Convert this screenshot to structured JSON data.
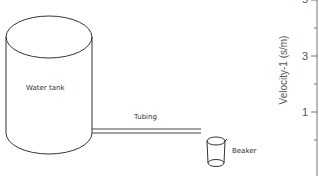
{
  "diagram": {
    "tank": {
      "label": "Water tank"
    },
    "tubing": {
      "label": "Tubing"
    },
    "beaker": {
      "label": "Beaker"
    }
  },
  "axis": {
    "label": "Velocity-1 (s/m)",
    "ticks": [
      {
        "label": "5",
        "y": 0
      },
      {
        "label": "3",
        "y": 56
      },
      {
        "label": "1",
        "y": 112
      }
    ]
  },
  "colors": {
    "stroke": "#333333",
    "axis": "#777777"
  }
}
